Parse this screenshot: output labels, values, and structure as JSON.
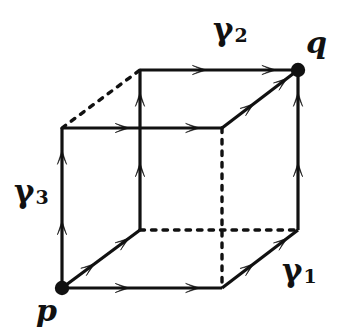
{
  "figure": {
    "type": "commutative-cube-diagram",
    "stroke_color": "#111111",
    "background_color": "#ffffff"
  },
  "vertices": [
    {
      "id": "p",
      "label": "p",
      "x": 62,
      "y": 288,
      "marker": "filled-dot",
      "label_x": 36,
      "label_y": 296
    },
    {
      "id": "q",
      "label": "q",
      "x": 298,
      "y": 70,
      "marker": "filled-dot",
      "label_x": 306,
      "label_y": 28
    },
    {
      "id": "fbr",
      "label": "",
      "x": 222,
      "y": 288,
      "marker": "none"
    },
    {
      "id": "ftl",
      "label": "",
      "x": 62,
      "y": 128,
      "marker": "none"
    },
    {
      "id": "ftr",
      "label": "",
      "x": 222,
      "y": 128,
      "marker": "none"
    },
    {
      "id": "bbl",
      "label": "",
      "x": 140,
      "y": 230,
      "marker": "none"
    },
    {
      "id": "bbr",
      "label": "",
      "x": 298,
      "y": 230,
      "marker": "none"
    },
    {
      "id": "btl",
      "label": "",
      "x": 140,
      "y": 70,
      "marker": "none"
    }
  ],
  "labels": {
    "gamma1": {
      "text": "γ",
      "sub": "1",
      "x": 282,
      "y": 255
    },
    "gamma2": {
      "text": "γ",
      "sub": "2",
      "x": 213,
      "y": 14
    },
    "gamma3": {
      "text": "γ",
      "sub": "3",
      "x": 14,
      "y": 176
    },
    "p": {
      "text": "p"
    },
    "q": {
      "text": "q"
    }
  },
  "edges": [
    {
      "name": "p-to-front-bottom-right",
      "from": "p",
      "to": "fbr",
      "style": "solid",
      "arrows": 2
    },
    {
      "name": "p-to-front-top-left",
      "from": "p",
      "to": "ftl",
      "style": "solid",
      "arrows": 2
    },
    {
      "name": "p-to-back-bottom-left",
      "from": "p",
      "to": "bbl",
      "style": "solid",
      "arrows": 2
    },
    {
      "name": "front-top-left-to-front-top-right",
      "from": "ftl",
      "to": "ftr",
      "style": "solid",
      "arrows": 2
    },
    {
      "name": "front-bottom-right-to-back-bottom-right",
      "from": "fbr",
      "to": "bbr",
      "style": "solid",
      "arrows": 2
    },
    {
      "name": "front-top-right-to-q",
      "from": "ftr",
      "to": "q",
      "style": "solid",
      "arrows": 2
    },
    {
      "name": "back-bottom-right-to-q",
      "from": "bbr",
      "to": "q",
      "style": "solid",
      "arrows": 2
    },
    {
      "name": "back-top-left-to-q",
      "from": "btl",
      "to": "q",
      "style": "solid",
      "arrows": 2
    },
    {
      "name": "back-bottom-left-to-back-top-left",
      "from": "bbl",
      "to": "btl",
      "style": "solid",
      "arrows": 2
    },
    {
      "name": "front-top-left-to-back-top-left",
      "from": "ftl",
      "to": "btl",
      "style": "dashed",
      "arrows": 0
    },
    {
      "name": "back-bottom-left-to-back-bottom-right",
      "from": "bbl",
      "to": "bbr",
      "style": "dashed",
      "arrows": 0
    },
    {
      "name": "front-top-right-to-front-bottom-right",
      "from": "ftr",
      "to": "fbr",
      "style": "dashed",
      "arrows": 0
    }
  ]
}
